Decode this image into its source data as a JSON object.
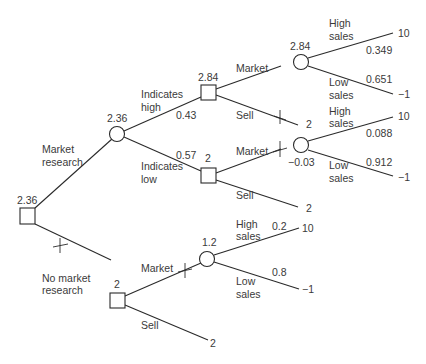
{
  "tree": {
    "root": {
      "type": "decision",
      "value": "2.36"
    },
    "market_research": {
      "label_line1": "Market",
      "label_line2": "research",
      "chance_value": "2.36",
      "indicates_high": {
        "label_line1": "Indicates",
        "label_line2": "high",
        "probability": "0.43",
        "decision_value": "2.84",
        "market": {
          "label": "Market",
          "chance_value": "2.84",
          "high_sales": {
            "label_line1": "High",
            "label_line2": "sales",
            "probability": "0.349",
            "payoff": "10"
          },
          "low_sales": {
            "label_line1": "Low",
            "label_line2": "sales",
            "probability": "0.651",
            "payoff": "−1"
          }
        },
        "sell": {
          "label": "Sell",
          "payoff": "2",
          "pruned": true
        }
      },
      "indicates_low": {
        "label_line1": "Indicates",
        "label_line2": "low",
        "probability": "0.57",
        "decision_value": "2",
        "market": {
          "label": "Market",
          "pruned": true,
          "chance_value": "−0.03",
          "high_sales": {
            "label_line1": "High",
            "label_line2": "sales",
            "probability": "0.088",
            "payoff": "10"
          },
          "low_sales": {
            "label_line1": "Low",
            "label_line2": "sales",
            "probability": "0.912",
            "payoff": "−1"
          }
        },
        "sell": {
          "label": "Sell",
          "payoff": "2"
        }
      }
    },
    "no_market_research": {
      "label_line1": "No market",
      "label_line2": "research",
      "pruned": true,
      "decision_value": "2",
      "market": {
        "label": "Market",
        "pruned": true,
        "chance_value": "1.2",
        "high_sales": {
          "label_line1": "High",
          "label_line2": "sales",
          "probability": "0.2",
          "payoff": "10"
        },
        "low_sales": {
          "label_line1": "Low",
          "label_line2": "sales",
          "probability": "0.8",
          "payoff": "−1"
        }
      },
      "sell": {
        "label": "Sell",
        "payoff": "2"
      }
    }
  }
}
